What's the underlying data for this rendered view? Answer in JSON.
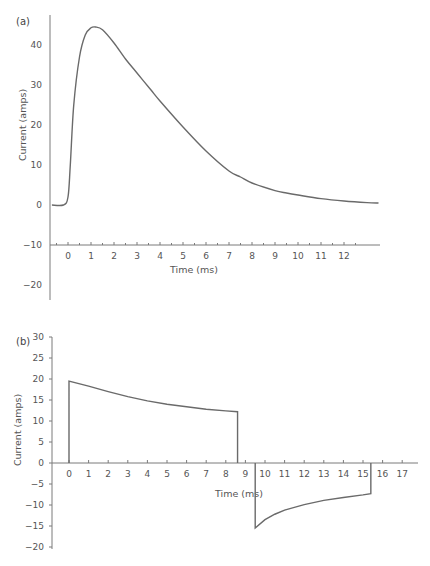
{
  "chart_data": [
    {
      "panel": "(a)",
      "type": "line",
      "xlabel": "Time (ms)",
      "ylabel": "Current (amps)",
      "x_ticks": [
        0,
        1,
        2,
        3,
        4,
        5,
        6,
        7,
        8,
        9,
        10,
        11,
        12
      ],
      "y_ticks": [
        40,
        30,
        20,
        10,
        0,
        -10,
        -20
      ],
      "y_tick_labels": [
        "40",
        "30",
        "20",
        "10",
        "0",
        "−10",
        "−20"
      ],
      "ylim": [
        -24,
        46
      ],
      "xlim": [
        -0.7,
        13.6
      ],
      "x_axis_at_y": -10,
      "grid": false,
      "series": [
        {
          "name": "current",
          "x": [
            -0.7,
            -0.2,
            0.0,
            0.1,
            0.25,
            0.5,
            0.75,
            1.0,
            1.2,
            1.5,
            2.0,
            2.5,
            3.0,
            3.6,
            4.0,
            5.0,
            6.0,
            7.0,
            7.5,
            8.0,
            9.0,
            9.5,
            10.0,
            11.0,
            12.0,
            13.0,
            13.5
          ],
          "y": [
            0,
            0,
            2,
            10,
            25,
            37,
            42.5,
            44.3,
            44.5,
            43.8,
            40.5,
            36.5,
            33,
            28.8,
            26,
            19.5,
            13.5,
            8.5,
            7,
            5.5,
            3.6,
            3,
            2.5,
            1.6,
            1.0,
            0.6,
            0.5
          ]
        }
      ]
    },
    {
      "panel": "(b)",
      "type": "line",
      "xlabel": "Time (ms)",
      "ylabel": "Current (amps)",
      "x_ticks": [
        0,
        1,
        2,
        3,
        4,
        5,
        6,
        7,
        8,
        9,
        10,
        11,
        12,
        13,
        14,
        15,
        16,
        17
      ],
      "y_ticks": [
        30,
        25,
        20,
        15,
        10,
        5,
        0,
        -5,
        -10,
        -15,
        -20
      ],
      "y_tick_labels": [
        "30",
        "25",
        "20",
        "15",
        "10",
        "5",
        "0",
        "−5",
        "−10",
        "−15",
        "−20"
      ],
      "ylim": [
        -21,
        30
      ],
      "xlim": [
        0,
        17.7
      ],
      "x_axis_at_y": 0,
      "grid": false,
      "series": [
        {
          "name": "positive pulse",
          "x": [
            0,
            0,
            1,
            2,
            3,
            4,
            5,
            6,
            7,
            8,
            8.6,
            8.6
          ],
          "y": [
            0,
            19.5,
            18.3,
            17.0,
            15.8,
            14.8,
            14.0,
            13.4,
            12.8,
            12.4,
            12.2,
            0
          ]
        },
        {
          "name": "negative pulse",
          "x": [
            9.5,
            9.5,
            10,
            10.5,
            11,
            12,
            13,
            14,
            15,
            15.4,
            15.4
          ],
          "y": [
            0,
            -15.5,
            -13.5,
            -12.2,
            -11.2,
            -9.9,
            -8.9,
            -8.2,
            -7.6,
            -7.3,
            0
          ]
        }
      ]
    }
  ]
}
